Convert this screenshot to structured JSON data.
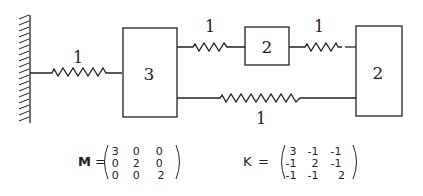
{
  "diagram": {
    "type": "mass-spring system",
    "wall": {
      "label": "fixed-wall"
    },
    "masses": [
      {
        "id": "m1",
        "label": "3"
      },
      {
        "id": "m2",
        "label": "2"
      },
      {
        "id": "m3",
        "label": "2"
      }
    ],
    "springs": [
      {
        "from": "wall",
        "to": "m1",
        "label": "1"
      },
      {
        "from": "m1",
        "to": "m2",
        "label": "1"
      },
      {
        "from": "m2",
        "to": "m3",
        "label": "1"
      },
      {
        "from": "m1",
        "to": "m3",
        "label": "1"
      }
    ]
  },
  "matrices": {
    "M": {
      "name": "M",
      "equals": "=",
      "rows": [
        [
          "3",
          "0",
          "0"
        ],
        [
          "0",
          "2",
          "0"
        ],
        [
          "0",
          "0",
          "2"
        ]
      ]
    },
    "K": {
      "name": "K",
      "equals": "=",
      "rows": [
        [
          "3",
          "-1",
          "-1"
        ],
        [
          "-1",
          "2",
          "-1"
        ],
        [
          "-1",
          "-1",
          "2"
        ]
      ]
    }
  }
}
